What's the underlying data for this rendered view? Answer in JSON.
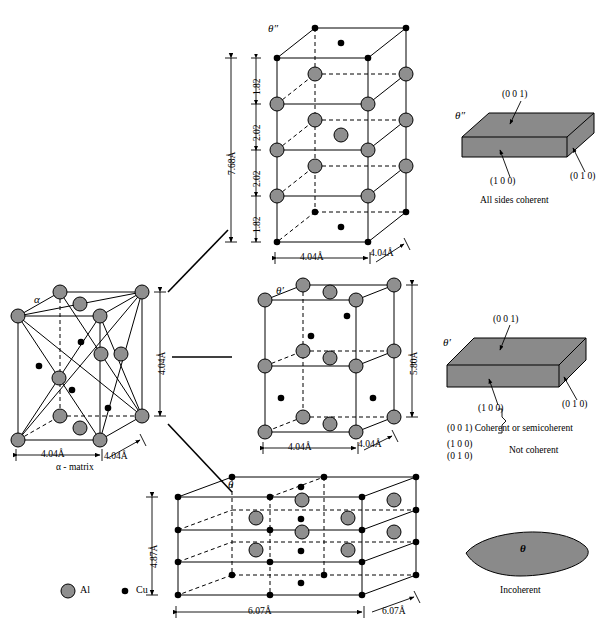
{
  "figure": {
    "type": "diagram",
    "legend": {
      "al_symbol": "al-atom-circle",
      "al_label": "Al",
      "cu_symbol": "cu-atom-dot",
      "cu_label": "Cu",
      "al_color": "#8f8f8f",
      "cu_color": "#000000"
    }
  },
  "matrix": {
    "phase_label": "α",
    "caption": "α - matrix",
    "dim_width": "4.04Å",
    "dim_depth": "4.04Å",
    "dim_height": "4.04Å"
  },
  "theta_double_prime": {
    "phase_label": "θ″",
    "dim_total_height": "7.68Å",
    "dim_segments": [
      "1.82",
      "2.02",
      "2.02",
      "1.82"
    ],
    "dim_width": "4.04Å",
    "dim_depth": "4.04Å"
  },
  "theta_prime": {
    "phase_label": "θ′",
    "dim_height": "5.80Å",
    "dim_width": "4.04Å",
    "dim_depth": "4.04Å"
  },
  "theta": {
    "phase_label": "θ",
    "dim_height": "4.87Å",
    "dim_width": "6.07Å",
    "dim_depth": "6.07Å"
  },
  "coherency_panels": [
    {
      "id": "panel-theta-double-prime",
      "phase_label": "θ″",
      "face_top": "(0 0 1)",
      "face_front": "(1 0 0)",
      "face_side": "(0 1 0)",
      "caption": "All sides coherent",
      "slab_color": "#8a8a8a"
    },
    {
      "id": "panel-theta-prime",
      "phase_label": "θ′",
      "face_top": "(0 0 1)",
      "face_front": "(1 0 0)",
      "face_side": "(0 1 0)",
      "note_line1": "(0 0 1) Coherent or semicoherent",
      "note_brace_top": "(1 0 0)",
      "note_brace_bottom": "(0 1 0)",
      "note_line2": "Not coherent",
      "slab_color": "#8a8a8a"
    },
    {
      "id": "panel-theta",
      "phase_label": "θ",
      "caption": "Incoherent",
      "shape": "lens-ellipse",
      "slab_color": "#8a8a8a"
    }
  ]
}
